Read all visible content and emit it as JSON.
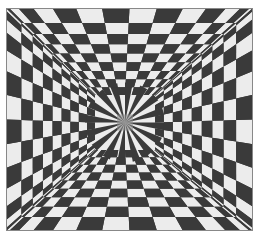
{
  "artwork": {
    "type": "op-art checkerboard illusion",
    "colors": {
      "dark": "#3a3a3a",
      "light": "#ececec",
      "background": "#ffffff",
      "frame": "#888888"
    },
    "bounds": {
      "x": 6,
      "y": 8,
      "width": 247,
      "height": 223
    },
    "center": {
      "x": 125,
      "y": 122
    },
    "inner_square": {
      "x": 95,
      "y": 95,
      "width": 60,
      "height": 55
    }
  }
}
